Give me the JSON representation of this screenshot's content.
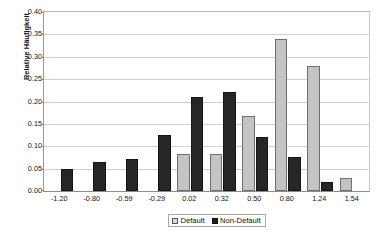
{
  "chart_data": {
    "type": "bar",
    "title": "",
    "subtitle": "",
    "xlabel": "",
    "ylabel": "Relative Häufigkeit",
    "ylim": [
      0.0,
      0.4
    ],
    "ytick_step": 0.05,
    "ytick_labels": [
      "0.40",
      "0.35",
      "0.30",
      "0.25",
      "0.20",
      "0.15",
      "0.10",
      "0.05",
      "0.00"
    ],
    "ytick_values": [
      0.4,
      0.35,
      0.3,
      0.25,
      0.2,
      0.15,
      0.1,
      0.05,
      0.0
    ],
    "grid": true,
    "grid_axis": "y",
    "legend_position": "bottom-center",
    "categories": [
      "-1.20",
      "-0.80",
      "-0.59",
      "-0.29",
      "0.02",
      "0.32",
      "0.50",
      "0.80",
      "1.24",
      "1.54"
    ],
    "series": [
      {
        "name": "Default",
        "color": "#c4c4c4",
        "values": [
          null,
          null,
          null,
          null,
          0.083,
          0.083,
          0.167,
          0.34,
          0.28,
          0.03
        ]
      },
      {
        "name": "Non-Default",
        "color": "#262626",
        "values": [
          0.05,
          0.065,
          0.072,
          0.125,
          0.21,
          0.222,
          0.12,
          0.077,
          0.021,
          null
        ]
      }
    ]
  },
  "legend": {
    "items": [
      {
        "label": "Default",
        "swatch": "light-gray-square"
      },
      {
        "label": "Non-Default",
        "swatch": "black-square"
      }
    ]
  }
}
